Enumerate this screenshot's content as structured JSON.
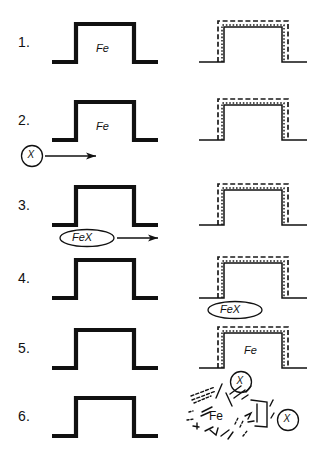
{
  "figure": {
    "colors": {
      "ink": "#111111",
      "background": "#ffffff",
      "coating_dash": "#1a1a1a"
    },
    "columns": [
      {
        "name": "uncoated-specimen",
        "label": ""
      },
      {
        "name": "coated-specimen",
        "label": ""
      }
    ],
    "rows": [
      {
        "number": "1.",
        "left": {
          "shape": "plateau-thick",
          "inner_label": "Fe",
          "coated": false
        },
        "right": {
          "shape": "plateau-thin",
          "inner_label": "",
          "coated": true
        },
        "annotations": []
      },
      {
        "number": "2.",
        "left": {
          "shape": "plateau-thick",
          "inner_label": "Fe",
          "coated": false
        },
        "right": {
          "shape": "plateau-thin",
          "inner_label": "",
          "coated": true
        },
        "annotations": [
          {
            "type": "circled-species-arrow",
            "label": "X",
            "side": "left"
          }
        ]
      },
      {
        "number": "3.",
        "left": {
          "shape": "plateau-thick",
          "inner_label": "",
          "coated": false
        },
        "right": {
          "shape": "plateau-thin",
          "inner_label": "",
          "coated": true
        },
        "annotations": [
          {
            "type": "ellipse-species-arrow",
            "label": "FeX",
            "side": "left"
          }
        ]
      },
      {
        "number": "4.",
        "left": {
          "shape": "plateau-thick",
          "inner_label": "",
          "coated": false
        },
        "right": {
          "shape": "plateau-thin",
          "inner_label": "",
          "coated": true
        },
        "annotations": [
          {
            "type": "ellipse-species",
            "label": "FeX",
            "side": "right"
          }
        ]
      },
      {
        "number": "5.",
        "left": {
          "shape": "plateau-thick",
          "inner_label": "",
          "coated": false
        },
        "right": {
          "shape": "plateau-thin",
          "inner_label": "Fe",
          "coated": true
        },
        "annotations": [
          {
            "type": "circled-species",
            "label": "X",
            "side": "right"
          }
        ]
      },
      {
        "number": "6.",
        "left": {
          "shape": "plateau-thick",
          "inner_label": "",
          "coated": false
        },
        "right": {
          "shape": "fragmented",
          "inner_label": "Fe",
          "coated": false
        },
        "annotations": [
          {
            "type": "circled-species",
            "label": "X",
            "side": "right"
          }
        ]
      }
    ],
    "species": {
      "iron": "Fe",
      "reactant": "X",
      "product": "FeX"
    }
  }
}
